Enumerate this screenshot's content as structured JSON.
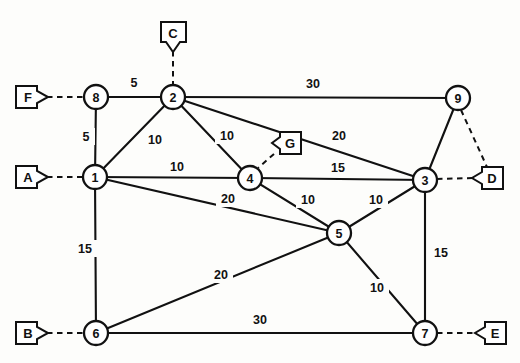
{
  "diagram": {
    "kind": "weighted-undirected-graph",
    "colors": {
      "background": "#fdfdfb",
      "ink": "#111111",
      "node_fill": "#ffffff"
    },
    "nodes": [
      {
        "id": "n8",
        "label": "8",
        "x": 96,
        "y": 97,
        "r": 12
      },
      {
        "id": "n2",
        "label": "2",
        "x": 173,
        "y": 97,
        "r": 12
      },
      {
        "id": "n9",
        "label": "9",
        "x": 458,
        "y": 98,
        "r": 12
      },
      {
        "id": "n1",
        "label": "1",
        "x": 95,
        "y": 177,
        "r": 12
      },
      {
        "id": "n4",
        "label": "4",
        "x": 250,
        "y": 178,
        "r": 12
      },
      {
        "id": "n3",
        "label": "3",
        "x": 425,
        "y": 180,
        "r": 12
      },
      {
        "id": "n5",
        "label": "5",
        "x": 339,
        "y": 233,
        "r": 12
      },
      {
        "id": "n6",
        "label": "6",
        "x": 96,
        "y": 333,
        "r": 12
      },
      {
        "id": "n7",
        "label": "7",
        "x": 425,
        "y": 333,
        "r": 12
      }
    ],
    "terminals": [
      {
        "id": "tF",
        "label": "F",
        "x": 31,
        "y": 97,
        "dir": "right",
        "attach": "n8"
      },
      {
        "id": "tC",
        "label": "C",
        "x": 173,
        "y": 33,
        "dir": "down",
        "attach": "n2"
      },
      {
        "id": "tA",
        "label": "A",
        "x": 31,
        "y": 177,
        "dir": "right",
        "attach": "n1"
      },
      {
        "id": "tG",
        "label": "G",
        "x": 289,
        "y": 143,
        "dir": "left",
        "attach": "n4"
      },
      {
        "id": "tD",
        "label": "D",
        "x": 491,
        "y": 178,
        "dir": "left",
        "attach": "n3"
      },
      {
        "id": "tB",
        "label": "B",
        "x": 31,
        "y": 333,
        "dir": "right",
        "attach": "n6"
      },
      {
        "id": "tE",
        "label": "E",
        "x": 494,
        "y": 333,
        "dir": "left",
        "attach": "n7"
      }
    ],
    "edges": [
      {
        "id": "e8-2",
        "from": "n8",
        "to": "n2",
        "weight": "5",
        "lx": 134,
        "ly": 83
      },
      {
        "id": "e8-1",
        "from": "n8",
        "to": "n1",
        "weight": "5",
        "lx": 86,
        "ly": 137
      },
      {
        "id": "e1-2",
        "from": "n1",
        "to": "n2",
        "weight": "10",
        "lx": 155,
        "ly": 140
      },
      {
        "id": "e2-4",
        "from": "n2",
        "to": "n4",
        "weight": "10",
        "lx": 227,
        "ly": 136
      },
      {
        "id": "e2-9",
        "from": "n2",
        "to": "n9",
        "weight": "30",
        "lx": 313,
        "ly": 84
      },
      {
        "id": "e2-3",
        "from": "n2",
        "to": "n3",
        "weight": "20",
        "lx": 339,
        "ly": 136
      },
      {
        "id": "e1-4",
        "from": "n1",
        "to": "n4",
        "weight": "10",
        "lx": 177,
        "ly": 167
      },
      {
        "id": "e4-3",
        "from": "n4",
        "to": "n3",
        "weight": "15",
        "lx": 338,
        "ly": 168
      },
      {
        "id": "e1-5",
        "from": "n1",
        "to": "n5",
        "weight": "20",
        "lx": 228,
        "ly": 199
      },
      {
        "id": "e4-5",
        "from": "n4",
        "to": "n5",
        "weight": "10",
        "lx": 308,
        "ly": 200
      },
      {
        "id": "e5-3",
        "from": "n5",
        "to": "n3",
        "weight": "10",
        "lx": 376,
        "ly": 200
      },
      {
        "id": "e1-6",
        "from": "n1",
        "to": "n6",
        "weight": "15",
        "lx": 85,
        "ly": 249
      },
      {
        "id": "e6-5",
        "from": "n6",
        "to": "n5",
        "weight": "20",
        "lx": 221,
        "ly": 275
      },
      {
        "id": "e6-7",
        "from": "n6",
        "to": "n7",
        "weight": "30",
        "lx": 260,
        "ly": 320
      },
      {
        "id": "e5-7",
        "from": "n5",
        "to": "n7",
        "weight": "10",
        "lx": 377,
        "ly": 288
      },
      {
        "id": "e3-7",
        "from": "n3",
        "to": "n7",
        "weight": "15",
        "lx": 437,
        "ly": 253
      },
      {
        "id": "e9-3",
        "from": "n9",
        "to": "n3",
        "weight": "",
        "lx": 0,
        "ly": 0
      }
    ],
    "dashed_links": [
      {
        "id": "d9-D",
        "from": "n9",
        "to": "tD"
      }
    ]
  }
}
